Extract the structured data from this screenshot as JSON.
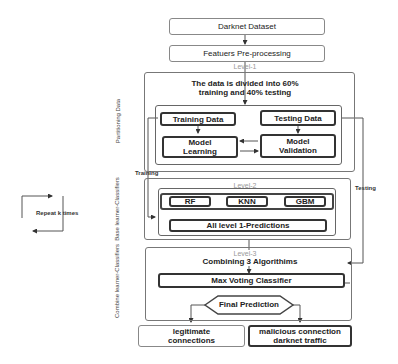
{
  "nodes": {
    "dataset": "Darknet Dataset",
    "preprocessing": "Featuers Pre-processing",
    "split_text": "The data is divided into 60% training and 40% testing",
    "training_data": "Training Data",
    "testing_data": "Testing Data",
    "model_learning": "Model Learning",
    "model_validation": "Model Validation",
    "rf": "RF",
    "knn": "KNN",
    "gbm": "GBM",
    "all_predictions": "All level 1-Predictions",
    "combining": "Combining 3 Algorithims",
    "max_voting": "Max Voting Classifier",
    "final_prediction": "Final Prediction",
    "legitimate": "legitimate connections",
    "malicious": "malicious connection darknet traffic"
  },
  "levels": {
    "level1": "Level-1",
    "level2": "Level-2",
    "level3": "Level-3"
  },
  "side_labels": {
    "partitioning": "Partitioning Data",
    "base": "Base learner-Classifiers",
    "combine": "Combine learner-Classifiers"
  },
  "edge_labels": {
    "training": "Training",
    "testing": "Testing",
    "repeat": "Repeat k times"
  }
}
